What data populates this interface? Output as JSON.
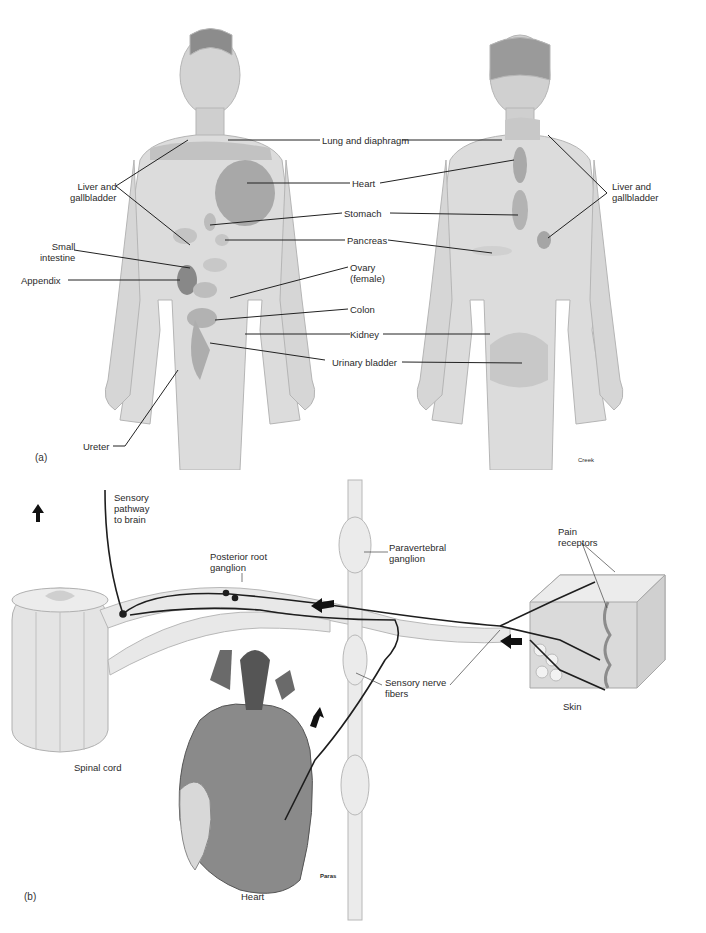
{
  "figure": {
    "panel_a": {
      "tag": "(a)",
      "credit": "Creek",
      "labels": {
        "lung_diaphragm": "Lung and diaphragm",
        "liver_gallbladder_front": [
          "Liver and",
          "gallbladder"
        ],
        "liver_gallbladder_back": [
          "Liver and",
          "gallbladder"
        ],
        "heart": "Heart",
        "stomach": "Stomach",
        "pancreas": "Pancreas",
        "small_intestine": [
          "Small",
          "intestine"
        ],
        "ovary": [
          "Ovary",
          "(female)"
        ],
        "appendix": "Appendix",
        "colon": "Colon",
        "kidney": "Kidney",
        "urinary_bladder": "Urinary bladder",
        "ureter": "Ureter"
      }
    },
    "panel_b": {
      "tag": "(b)",
      "credit": "Paras",
      "labels": {
        "sensory_pathway": [
          "Sensory",
          "pathway",
          "to brain"
        ],
        "posterior_root_ganglion": [
          "Posterior root",
          "ganglion"
        ],
        "paravertebral_ganglion": [
          "Paravertebral",
          "ganglion"
        ],
        "pain_receptors": [
          "Pain",
          "receptors"
        ],
        "sensory_nerve_fibers": [
          "Sensory nerve",
          "fibers"
        ],
        "skin": "Skin",
        "spinal_cord": "Spinal cord",
        "heart": "Heart"
      }
    },
    "colors": {
      "body_shade": "#d9d9d9",
      "body_outline": "#b8b8b8",
      "referred_zone": "#bdbdbd",
      "organ_dark": "#8e8e8e",
      "nerve": "#1e1e1e",
      "label_line": "#222222"
    }
  }
}
